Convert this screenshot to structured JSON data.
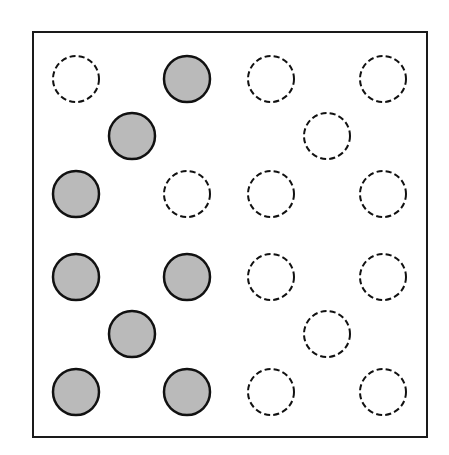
{
  "diagram": {
    "frame": {
      "x": 33,
      "y": 32,
      "width": 394,
      "height": 405,
      "stroke": "#1a1a1a",
      "stroke_width": 2
    },
    "circle_radius": 23,
    "filled_style": {
      "fill": "#bababa",
      "stroke": "#111111",
      "stroke_width": 2.5
    },
    "empty_style": {
      "fill": "none",
      "stroke": "#111111",
      "stroke_width": 2,
      "dash": "6 3.2"
    },
    "circles": [
      {
        "cx": 76,
        "cy": 79,
        "filled": false
      },
      {
        "cx": 187,
        "cy": 79,
        "filled": true
      },
      {
        "cx": 271,
        "cy": 79,
        "filled": false
      },
      {
        "cx": 383,
        "cy": 79,
        "filled": false
      },
      {
        "cx": 132,
        "cy": 136,
        "filled": true
      },
      {
        "cx": 327,
        "cy": 136,
        "filled": false
      },
      {
        "cx": 76,
        "cy": 194,
        "filled": true
      },
      {
        "cx": 187,
        "cy": 194,
        "filled": false
      },
      {
        "cx": 271,
        "cy": 194,
        "filled": false
      },
      {
        "cx": 383,
        "cy": 194,
        "filled": false
      },
      {
        "cx": 76,
        "cy": 277,
        "filled": true
      },
      {
        "cx": 187,
        "cy": 277,
        "filled": true
      },
      {
        "cx": 271,
        "cy": 277,
        "filled": false
      },
      {
        "cx": 383,
        "cy": 277,
        "filled": false
      },
      {
        "cx": 132,
        "cy": 334,
        "filled": true
      },
      {
        "cx": 327,
        "cy": 334,
        "filled": false
      },
      {
        "cx": 76,
        "cy": 392,
        "filled": true
      },
      {
        "cx": 187,
        "cy": 392,
        "filled": true
      },
      {
        "cx": 271,
        "cy": 392,
        "filled": false
      },
      {
        "cx": 383,
        "cy": 392,
        "filled": false
      }
    ]
  }
}
